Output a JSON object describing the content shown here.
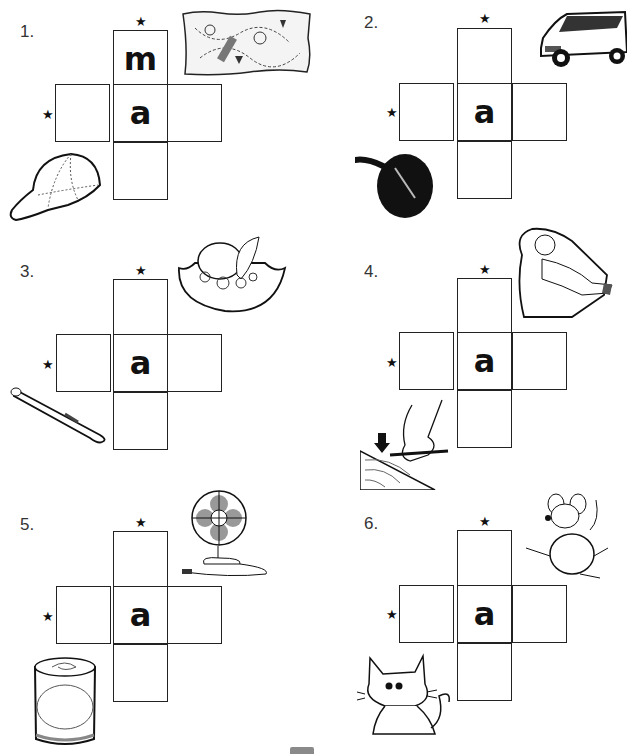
{
  "worksheet": {
    "vowel": "a",
    "puzzles": [
      {
        "number": "1.",
        "center_letter": "a",
        "given_letters": {
          "top": "m",
          "left": "",
          "right": "",
          "bottom": ""
        },
        "pictures": [
          "treasure-map",
          "baseball-cap"
        ],
        "across_clue_picture": "baseball-cap",
        "down_clue_picture": "treasure-map"
      },
      {
        "number": "2.",
        "center_letter": "a",
        "given_letters": {
          "top": "",
          "left": "",
          "right": "",
          "bottom": ""
        },
        "pictures": [
          "van",
          "frying-pan"
        ],
        "across_clue_picture": "frying-pan",
        "down_clue_picture": "van"
      },
      {
        "number": "3.",
        "center_letter": "a",
        "given_letters": {
          "top": "",
          "left": "",
          "right": "",
          "bottom": ""
        },
        "pictures": [
          "hat",
          "baseball-bat"
        ],
        "across_clue_picture": "baseball-bat",
        "down_clue_picture": "hat"
      },
      {
        "number": "4.",
        "center_letter": "a",
        "given_letters": {
          "top": "",
          "left": "",
          "right": "",
          "bottom": ""
        },
        "pictures": [
          "man-napping",
          "hand-drawing-on-map"
        ],
        "across_clue_picture": "hand-drawing-on-map",
        "down_clue_picture": "man-napping"
      },
      {
        "number": "5.",
        "center_letter": "a",
        "given_letters": {
          "top": "",
          "left": "",
          "right": "",
          "bottom": ""
        },
        "pictures": [
          "fan",
          "can"
        ],
        "across_clue_picture": "can",
        "down_clue_picture": "fan"
      },
      {
        "number": "6.",
        "center_letter": "a",
        "given_letters": {
          "top": "",
          "left": "",
          "right": "",
          "bottom": ""
        },
        "pictures": [
          "rat",
          "cat"
        ],
        "across_clue_picture": "cat",
        "down_clue_picture": "rat"
      }
    ],
    "star_glyph": "★"
  }
}
